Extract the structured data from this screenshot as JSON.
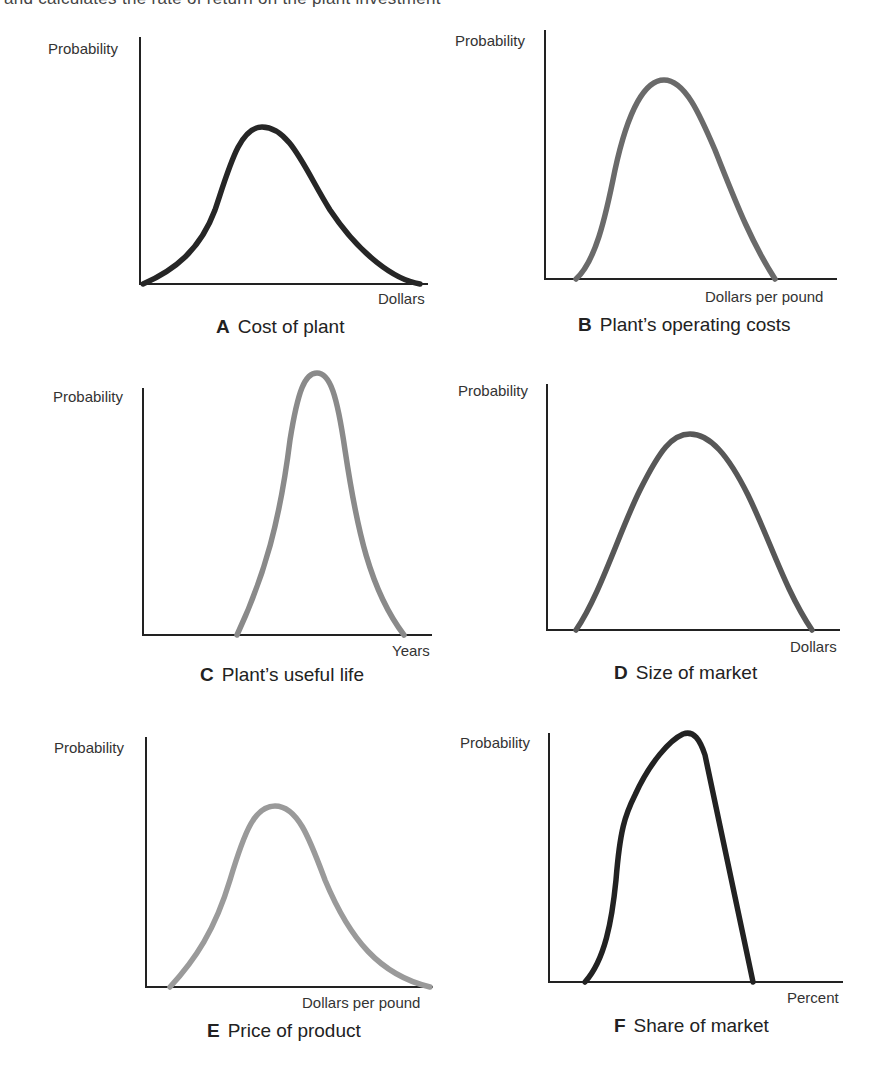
{
  "header": {
    "cutoff_text": "and calculates the rate of return on the plant investment"
  },
  "chart_data": [
    {
      "type": "line",
      "panel": "A",
      "title": "Cost of plant",
      "xlabel": "Dollars",
      "ylabel": "Probability",
      "shape": "right-skewed bell curve",
      "color": "#262626",
      "axis": {
        "origin": [
          140,
          284
        ],
        "y_top": 37,
        "x_end": 428
      },
      "path": "M143,284 C175,270 200,250 215,210 C230,165 240,127 262,127 C290,127 305,170 330,210 C360,255 395,280 420,284"
    },
    {
      "type": "line",
      "panel": "B",
      "title": "Plant's operating costs",
      "xlabel": "Dollars per pound",
      "ylabel": "Probability",
      "shape": "slightly right-skewed bell curve",
      "color": "#6a6a6a",
      "axis": {
        "origin": [
          545,
          279
        ],
        "y_top": 30,
        "x_end": 837
      },
      "path": "M576,279 C595,262 605,220 615,170 C628,110 645,80 664,80 C685,80 700,115 715,150 C735,200 750,240 775,279"
    },
    {
      "type": "line",
      "panel": "C",
      "title": "Plant's useful life",
      "xlabel": "Years",
      "ylabel": "Probability",
      "shape": "narrow tall bell curve",
      "color": "#8a8a8a",
      "axis": {
        "origin": [
          143,
          635
        ],
        "y_top": 388,
        "x_end": 432
      },
      "path": "M237,635 C265,575 280,520 290,440 C298,390 305,373 317,373 C330,373 337,395 345,450 C357,530 370,590 404,635"
    },
    {
      "type": "line",
      "panel": "D",
      "title": "Size of market",
      "xlabel": "Dollars",
      "ylabel": "Probability",
      "shape": "wide symmetric bell curve",
      "color": "#575757",
      "axis": {
        "origin": [
          547,
          630
        ],
        "y_top": 384,
        "x_end": 840
      },
      "path": "M576,630 C600,595 620,530 640,490 C660,450 672,434 690,434 C710,434 728,455 748,495 C770,540 785,590 812,630"
    },
    {
      "type": "line",
      "panel": "E",
      "title": "Price of product",
      "xlabel": "Dollars per pound",
      "ylabel": "Probability",
      "shape": "right-skewed bell curve",
      "color": "#9a9a9a",
      "axis": {
        "origin": [
          146,
          987
        ],
        "y_top": 737,
        "x_end": 433
      },
      "path": "M170,987 C195,960 215,930 230,880 C245,830 255,806 275,806 C298,806 310,840 325,880 C350,940 380,975 430,987"
    },
    {
      "type": "line",
      "panel": "F",
      "title": "Share of market",
      "xlabel": "Percent",
      "ylabel": "Probability",
      "shape": "left-skewed, sharply falling right side",
      "color": "#222222",
      "axis": {
        "origin": [
          549,
          982
        ],
        "y_top": 733,
        "x_end": 843
      },
      "path": "M585,982 C605,960 612,920 616,880 C620,830 625,815 635,795 C650,762 670,740 683,734 C694,730 700,740 705,755 L753,982"
    }
  ],
  "panels": {
    "a": {
      "letter": "A",
      "title": "Cost of plant",
      "ylabel": "Probability",
      "xlabel": "Dollars"
    },
    "b": {
      "letter": "B",
      "title": "Plant’s operating costs",
      "ylabel": "Probability",
      "xlabel": "Dollars per pound"
    },
    "c": {
      "letter": "C",
      "title": "Plant’s useful life",
      "ylabel": "Probability",
      "xlabel": "Years"
    },
    "d": {
      "letter": "D",
      "title": "Size of market",
      "ylabel": "Probability",
      "xlabel": "Dollars"
    },
    "e": {
      "letter": "E",
      "title": "Price of product",
      "ylabel": "Probability",
      "xlabel": "Dollars per pound"
    },
    "f": {
      "letter": "F",
      "title": "Share of market",
      "ylabel": "Probability",
      "xlabel": "Percent"
    }
  },
  "colors": {
    "axis": "#222222"
  }
}
